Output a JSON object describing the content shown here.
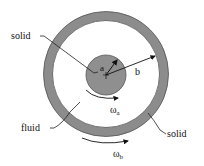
{
  "diagram": {
    "labels": {
      "inner_solid": "solid",
      "outer_solid": "solid",
      "fluid": "fluid",
      "radius_inner": "a",
      "radius_outer": "b",
      "omega_inner": "ω",
      "omega_inner_sub": "a",
      "omega_outer": "ω",
      "omega_outer_sub": "b"
    },
    "colors": {
      "solid_fill": "#8f8f8f",
      "ring_fill": "#8c8c8c",
      "fluid_fill": "#ffffff",
      "stroke": "#333333",
      "text": "#111111"
    }
  }
}
